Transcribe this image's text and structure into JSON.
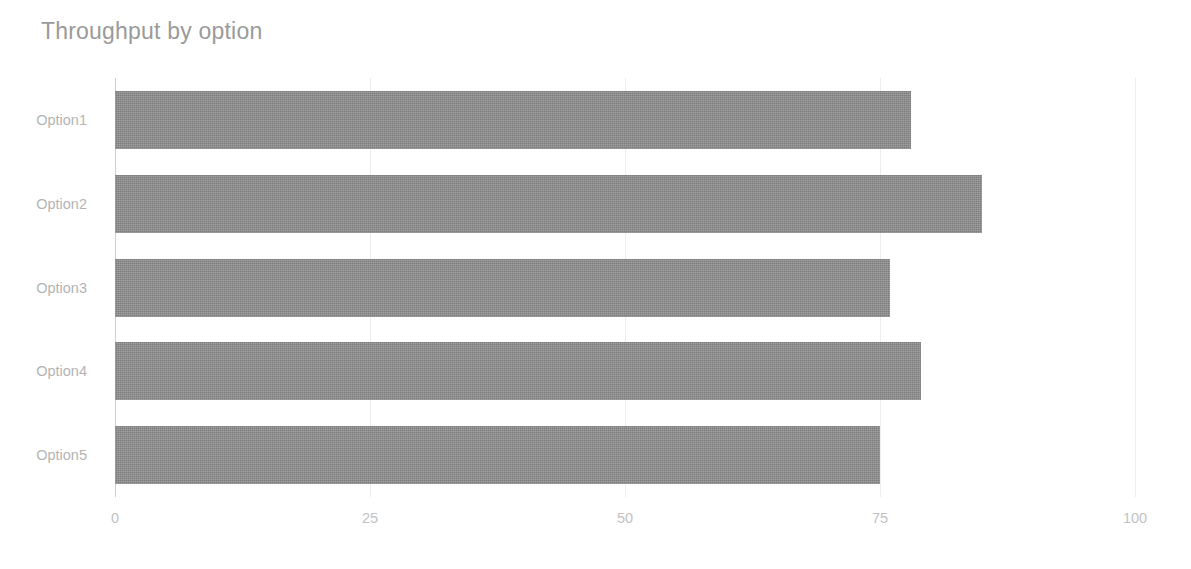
{
  "chart_data": {
    "type": "bar",
    "orientation": "horizontal",
    "title": "Throughput by option",
    "xlabel": "",
    "ylabel": "",
    "categories": [
      "Option1",
      "Option2",
      "Option3",
      "Option4",
      "Option5"
    ],
    "values": [
      78,
      85,
      76,
      79,
      75
    ],
    "series": [
      {
        "name": "Throughput",
        "values": [
          78,
          85,
          76,
          79,
          75
        ]
      }
    ],
    "xlim": [
      0,
      100
    ],
    "xticks": [
      0,
      25,
      50,
      75,
      100
    ],
    "xtick_labels": [
      "0",
      "25",
      "50",
      "75",
      "100"
    ],
    "grid": true,
    "legend": false,
    "bar_color": "#8a8a8a",
    "gridline_color": "#ededed",
    "axis_color": "#cfcfcf",
    "title_color": "#9a9a9a",
    "label_color": "#b4b4b4",
    "tick_label_color": "#c2c2c2",
    "background_color": "#ffffff"
  }
}
